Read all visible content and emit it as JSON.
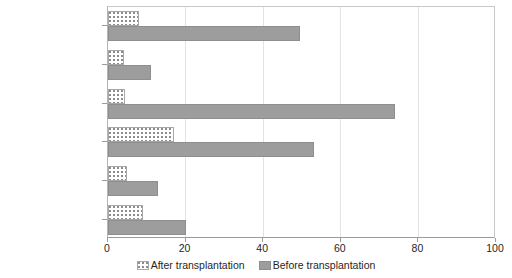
{
  "chart_data": {
    "type": "bar",
    "orientation": "horizontal",
    "title": "",
    "xlabel": "",
    "ylabel": "",
    "xlim": [
      0,
      100
    ],
    "xticks": [
      0,
      20,
      40,
      60,
      80,
      100
    ],
    "xticklabels": [
      "0",
      "20",
      "40",
      "60",
      "80",
      "100"
    ],
    "grid": "vertical",
    "legend_position": "bottom-center",
    "categories": [
      "Mobility",
      "Pain",
      "Energy",
      "Sleep",
      "Social isolation",
      "Emotional reactions"
    ],
    "series": [
      {
        "name": "After transplantation",
        "style": "hatched-dotted",
        "color": "#ffffff",
        "values": [
          8,
          4,
          4.5,
          17,
          5,
          9
        ]
      },
      {
        "name": "Before transplantation",
        "style": "solid",
        "color": "#9d9d9d",
        "values": [
          49.5,
          11,
          74,
          53,
          13,
          20
        ]
      }
    ]
  },
  "legend": {
    "entries": [
      {
        "label": "After transplantation"
      },
      {
        "label": "Before transplantation"
      }
    ]
  },
  "colors": {
    "before_fill": "#9d9d9d",
    "after_fill": "#ffffff",
    "after_dot": "#8c8c8c",
    "gridline": "#e3e3e3",
    "axis": "#9a9a9a",
    "text": "#1f1f1f"
  }
}
